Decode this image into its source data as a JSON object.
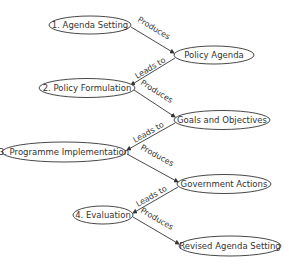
{
  "diagram": {
    "type": "flow",
    "colors": {
      "stroke": "#333333",
      "text": "#333333",
      "background": "#ffffff"
    },
    "nodes": [
      {
        "id": "n1",
        "label": "1. Agenda Setting",
        "cx": 90,
        "cy": 25,
        "rx": 41,
        "ry": 9
      },
      {
        "id": "n2",
        "label": "Policy Agenda",
        "cx": 214,
        "cy": 55,
        "rx": 40,
        "ry": 9
      },
      {
        "id": "n3",
        "label": "2. Policy Formulation",
        "cx": 87,
        "cy": 88,
        "rx": 48,
        "ry": 9.5
      },
      {
        "id": "n4",
        "label": "Goals and Objectives",
        "cx": 222,
        "cy": 120,
        "rx": 48,
        "ry": 9.5
      },
      {
        "id": "n5",
        "label": "3. Programme Implementation",
        "cx": 64,
        "cy": 152,
        "rx": 62,
        "ry": 10
      },
      {
        "id": "n6",
        "label": "Government Actions",
        "cx": 224,
        "cy": 184,
        "rx": 47,
        "ry": 9.5
      },
      {
        "id": "n7",
        "label": "4. Evaluation",
        "cx": 103,
        "cy": 215,
        "rx": 30,
        "ry": 9
      },
      {
        "id": "n8",
        "label": "Revised Agenda Setting",
        "cx": 230,
        "cy": 246,
        "rx": 51,
        "ry": 10
      }
    ],
    "edges": [
      {
        "from": "n1",
        "to": "n2",
        "label": "Produces"
      },
      {
        "from": "n2",
        "to": "n3",
        "label": "Leads to"
      },
      {
        "from": "n3",
        "to": "n4",
        "label": "Produces"
      },
      {
        "from": "n4",
        "to": "n5",
        "label": "Leads to"
      },
      {
        "from": "n5",
        "to": "n6",
        "label": "Produces"
      },
      {
        "from": "n6",
        "to": "n7",
        "label": "Leads to"
      },
      {
        "from": "n7",
        "to": "n8",
        "label": "Produces"
      }
    ]
  }
}
